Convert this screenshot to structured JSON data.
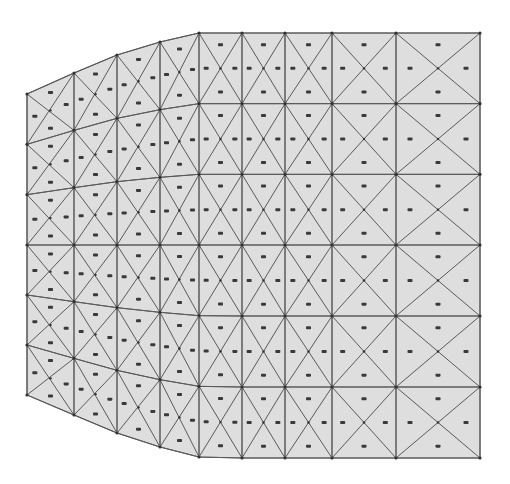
{
  "diagram": {
    "type": "triangulated-mesh",
    "colors": {
      "background": "#ffffff",
      "fill": "#dedede",
      "edge": "#5a5a5a",
      "node": "#333333",
      "label": "#3a3a3a"
    },
    "grid": {
      "columns_x": [
        27,
        74,
        117,
        160,
        199,
        242,
        285,
        332,
        396,
        480
      ],
      "column_top_y": [
        94,
        73,
        55,
        42,
        33,
        33,
        33,
        33,
        33,
        33
      ],
      "column_bottom_y": [
        395,
        415,
        433,
        447,
        457,
        458,
        458,
        458,
        458,
        458
      ],
      "rows": 7,
      "center_row_y": 245
    },
    "cell_count": {
      "columns": 9,
      "rows": 6,
      "triangles_per_cell": 4
    },
    "labels_legible": false
  }
}
